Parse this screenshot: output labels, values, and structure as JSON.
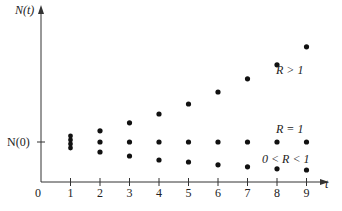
{
  "chart_data": {
    "type": "scatter",
    "title": "",
    "xlabel": "t",
    "ylabel": "N(t)",
    "x_ticks": [
      0,
      1,
      2,
      3,
      4,
      5,
      6,
      7,
      8,
      9
    ],
    "y_tick_labels": [
      "N(0)"
    ],
    "y_reference": 1,
    "xlim": [
      0,
      9.6
    ],
    "ylim": [
      0,
      4.2
    ],
    "grid": false,
    "legend": "none (inline series labels at right)",
    "x": [
      1,
      2,
      3,
      4,
      5,
      6,
      7,
      8,
      9
    ],
    "series": [
      {
        "name": "R > 1",
        "label": "R > 1",
        "values": [
          1.0,
          1.28,
          1.48,
          1.7,
          1.95,
          2.25,
          2.58,
          2.93,
          3.38
        ]
      },
      {
        "name": "R = 1",
        "label": "R = 1",
        "values": [
          1.0,
          1.0,
          1.0,
          1.0,
          1.0,
          1.0,
          1.0,
          1.0,
          1.0
        ]
      },
      {
        "name": "0 < R < 1",
        "label": "0 < R < 1",
        "values": [
          1.0,
          0.75,
          0.65,
          0.55,
          0.5,
          0.43,
          0.38,
          0.33,
          0.3
        ]
      }
    ],
    "note": "At t = 1 all three series start at N(0); drawn as a tight cluster of dots."
  }
}
